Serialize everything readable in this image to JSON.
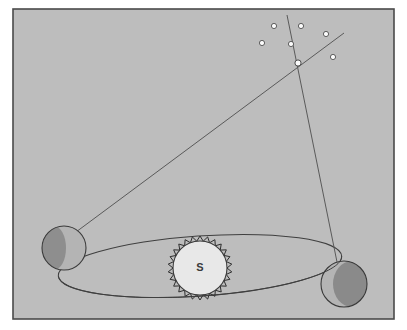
{
  "figure": {
    "background_color": "#ffffff",
    "panel_color": "#bdbdbd",
    "panel_border_color": "#4a4a4a",
    "line_color": "#5a5a5a",
    "orbit_color": "#3f3f3f"
  },
  "panel": {
    "x": 13,
    "y": 9,
    "width": 381,
    "height": 310
  },
  "sun": {
    "label": "S",
    "cx": 200,
    "cy": 268,
    "r": 27,
    "fill": "#e8e8e8",
    "corona_color": "#2e2e2e",
    "corona_spikes": 26,
    "corona_length": 5
  },
  "orbit": {
    "cx": 200,
    "cy": 266,
    "rx": 142,
    "ry": 30,
    "rotation_deg": -4,
    "stroke": "#3f3f3f",
    "stroke_width": 1
  },
  "earths": [
    {
      "name": "earth-position-a",
      "position_label": "left",
      "cx": 64,
      "cy": 248,
      "r": 22,
      "lit_fill": "#b4b4b4",
      "dark_fill": "#8e8e8e",
      "dark_side": "left",
      "outline": "#3a3a3a"
    },
    {
      "name": "earth-position-b",
      "position_label": "right",
      "cx": 344,
      "cy": 284,
      "r": 23,
      "lit_fill": "#b4b4b4",
      "dark_fill": "#8a8a8a",
      "dark_side": "right",
      "outline": "#3a3a3a"
    }
  ],
  "target_star": {
    "name": "nearby-star",
    "cx": 298,
    "cy": 63,
    "r": 3.1,
    "fill": "#fbfbfb",
    "outline": "#4a4a4a"
  },
  "sight_lines": [
    {
      "name": "sight-line-from-left-earth",
      "x1": 76,
      "y1": 232,
      "x2": 344,
      "y2": 33,
      "stroke": "#5a5a5a",
      "stroke_width": 1
    },
    {
      "name": "sight-line-from-right-earth",
      "x1": 337,
      "y1": 262,
      "x2": 287,
      "y2": 15,
      "stroke": "#5a5a5a",
      "stroke_width": 1
    }
  ],
  "background_stars": [
    {
      "name": "background-star-1",
      "cx": 274,
      "cy": 26,
      "r": 2.6
    },
    {
      "name": "background-star-2",
      "cx": 301,
      "cy": 26,
      "r": 2.6
    },
    {
      "name": "background-star-3",
      "cx": 262,
      "cy": 43,
      "r": 2.6
    },
    {
      "name": "background-star-4",
      "cx": 291,
      "cy": 44,
      "r": 2.6
    },
    {
      "name": "background-star-5",
      "cx": 326,
      "cy": 34,
      "r": 2.6
    },
    {
      "name": "background-star-6",
      "cx": 333,
      "cy": 57,
      "r": 2.6
    }
  ],
  "star_style": {
    "fill": "#fcfcfc",
    "outline": "#4f4f4f",
    "outline_width": 0.9
  }
}
